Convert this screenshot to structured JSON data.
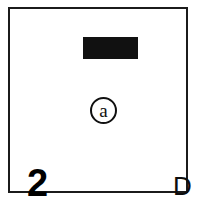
{
  "figure": {
    "type": "scanned-figure-panel",
    "panel_letter": "D",
    "panel_number": "2",
    "circle_label": "a",
    "redaction_bar": {
      "name": "black-bar",
      "color": "#111111"
    },
    "frame": {
      "color": "#1b1b1b"
    },
    "background_color": "#ffffff"
  }
}
